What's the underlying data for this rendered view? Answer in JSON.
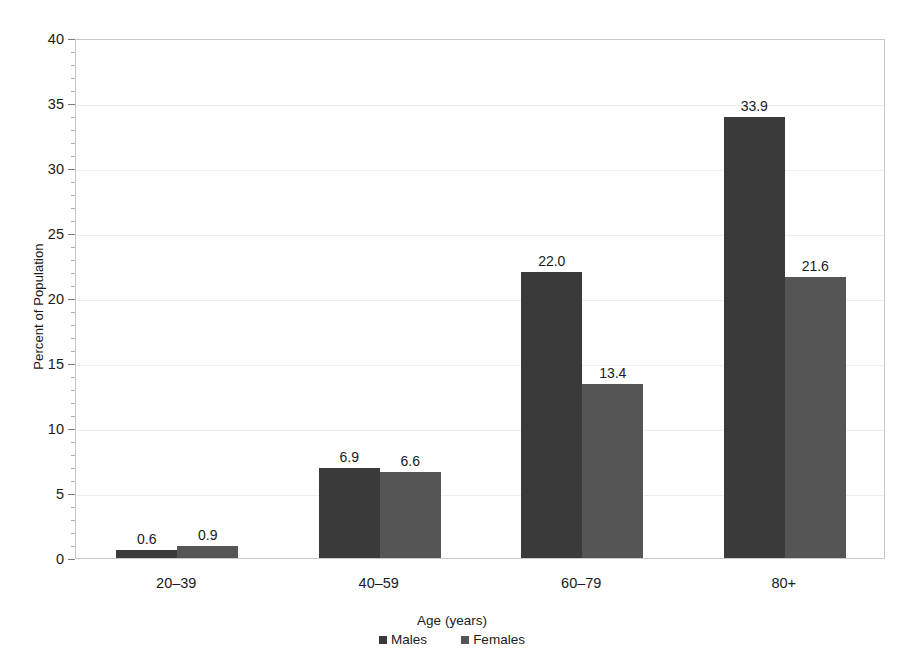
{
  "chart_data": {
    "type": "bar",
    "title": "",
    "xlabel": "Age (years)",
    "ylabel": "Percent of Population",
    "categories": [
      "20–39",
      "40–59",
      "60–79",
      "80+"
    ],
    "series": [
      {
        "name": "Males",
        "color": "#3a3a3a",
        "values": [
          0.6,
          6.9,
          22.0,
          33.9
        ],
        "labels": [
          "0.6",
          "6.9",
          "22.0",
          "33.9"
        ]
      },
      {
        "name": "Females",
        "color": "#555555",
        "values": [
          0.9,
          6.6,
          13.4,
          21.6
        ],
        "labels": [
          "0.9",
          "6.6",
          "13.4",
          "21.6"
        ]
      }
    ],
    "ylim": [
      0,
      40
    ],
    "ytick_labels": [
      "0",
      "5",
      "10",
      "15",
      "20",
      "25",
      "30",
      "35",
      "40"
    ],
    "ytick_values": [
      0,
      5,
      10,
      15,
      20,
      25,
      30,
      35,
      40
    ],
    "yminor_step": 1,
    "grid": "horizontal-major",
    "legend_position": "bottom-center",
    "legend_entries": [
      "Males",
      "Females"
    ],
    "background_color": "#ffffff",
    "grid_color": "#ededed",
    "axis_color": "#c9c9c9"
  }
}
